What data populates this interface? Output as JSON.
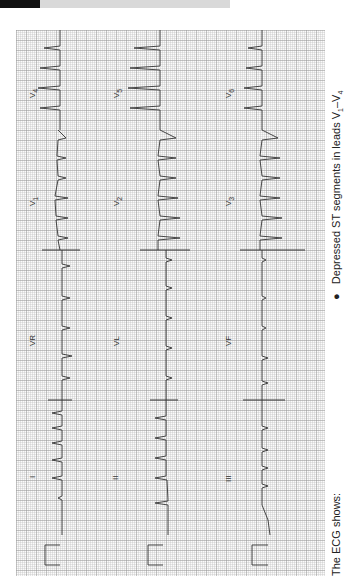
{
  "figure": {
    "type": "12-lead ECG",
    "orientation": "rotated 90 degrees",
    "leads": {
      "row1": [
        "I",
        "VR",
        "V1",
        "V4"
      ],
      "row2": [
        "II",
        "VL",
        "V2",
        "V5"
      ],
      "row3": [
        "III",
        "VF",
        "V3",
        "V6"
      ]
    },
    "trace_color": "#333333",
    "grid_color": "#b4b4b4"
  },
  "labels": {
    "I": "I",
    "II": "II",
    "III": "III",
    "VR": "VR",
    "VL": "VL",
    "VF": "VF",
    "V1": "V",
    "V1_sub": "1",
    "V2": "V",
    "V2_sub": "2",
    "V3": "V",
    "V3_sub": "3",
    "V4": "V",
    "V4_sub": "4",
    "V5": "V",
    "V5_sub": "5",
    "V6": "V",
    "V6_sub": "6"
  },
  "caption": {
    "intro": "The ECG shows:",
    "bullet_symbol": "●",
    "bullet_text": "Depressed ST segments in leads V",
    "sub_start": "1",
    "dash": "–V",
    "sub_end": "4"
  }
}
